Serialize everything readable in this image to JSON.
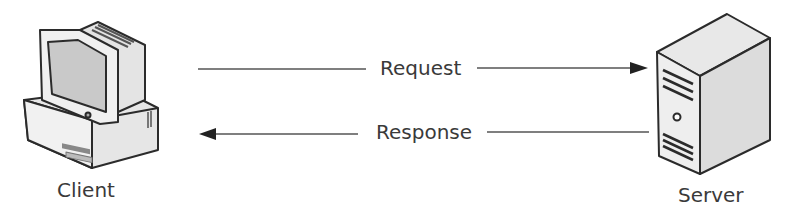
{
  "diagram": {
    "nodes": [
      {
        "id": "client",
        "label": "Client",
        "icon": "desktop-computer-icon"
      },
      {
        "id": "server",
        "label": "Server",
        "icon": "tower-server-icon"
      }
    ],
    "edges": [
      {
        "from": "client",
        "to": "server",
        "label": "Request"
      },
      {
        "from": "server",
        "to": "client",
        "label": "Response"
      }
    ],
    "colors": {
      "stroke": "#2b2b2b",
      "fill_light": "#ececec",
      "fill_mid": "#d8d8d8",
      "screen": "#c6c6c6"
    }
  }
}
